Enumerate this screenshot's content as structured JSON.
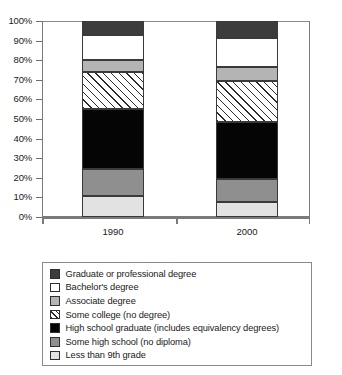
{
  "chart_data": {
    "type": "bar",
    "subtype": "stacked-bar-100-percent",
    "title": "",
    "xlabel": "",
    "ylabel": "",
    "categories": [
      "1990",
      "2000"
    ],
    "ylim": [
      0,
      100
    ],
    "ytick_labels": [
      "0%",
      "10%",
      "20%",
      "30%",
      "40%",
      "50%",
      "60%",
      "70%",
      "80%",
      "90%",
      "100%"
    ],
    "ytick_values": [
      0,
      10,
      20,
      30,
      40,
      50,
      60,
      70,
      80,
      90,
      100
    ],
    "grid": false,
    "legend_position": "below",
    "stack_order_bottom_to_top": [
      "Less than 9th grade",
      "Some high school (no diploma)",
      "High school graduate (includes equivalency degrees)",
      "Some college (no degree)",
      "Associate degree",
      "Bachelor's degree",
      "Graduate or professional degree"
    ],
    "series": [
      {
        "name": "Less than 9th grade",
        "fill": "#e2e2e2",
        "pattern": "solid",
        "values": [
          10.5,
          7.5
        ],
        "cumulative_top": [
          10.5,
          7.5
        ]
      },
      {
        "name": "Some high school (no diploma)",
        "fill": "#8f8f8f",
        "pattern": "solid",
        "values": [
          14.0,
          12.0
        ],
        "cumulative_top": [
          24.5,
          19.5
        ]
      },
      {
        "name": "High school graduate (includes equivalency degrees)",
        "fill": "#050505",
        "pattern": "solid",
        "values": [
          30.5,
          29.0
        ],
        "cumulative_top": [
          55.0,
          48.5
        ]
      },
      {
        "name": "Some college (no degree)",
        "fill": "#ffffff",
        "pattern": "diagonal-hatch",
        "values": [
          19.0,
          21.0
        ],
        "cumulative_top": [
          74.0,
          69.5
        ]
      },
      {
        "name": "Associate degree",
        "fill": "#b4b4b4",
        "pattern": "solid",
        "values": [
          6.0,
          7.0
        ],
        "cumulative_top": [
          80.0,
          76.5
        ]
      },
      {
        "name": "Bachelor's degree",
        "fill": "#ffffff",
        "pattern": "solid",
        "values": [
          13.0,
          15.0
        ],
        "cumulative_top": [
          93.0,
          91.5
        ]
      },
      {
        "name": "Graduate or professional degree",
        "fill": "#3c3c3c",
        "pattern": "solid",
        "values": [
          7.0,
          8.5
        ],
        "cumulative_top": [
          100.0,
          100.0
        ]
      }
    ]
  },
  "legend": {
    "items": [
      {
        "label": "Graduate or professional degree",
        "fill": "#3c3c3c",
        "pattern": "solid"
      },
      {
        "label": "Bachelor's degree",
        "fill": "#ffffff",
        "pattern": "solid"
      },
      {
        "label": "Associate degree",
        "fill": "#b4b4b4",
        "pattern": "solid"
      },
      {
        "label": "Some college (no degree)",
        "fill": "#ffffff",
        "pattern": "diagonal-hatch"
      },
      {
        "label": "High school graduate (includes equivalency degrees)",
        "fill": "#050505",
        "pattern": "solid"
      },
      {
        "label": "Some high school (no diploma)",
        "fill": "#8f8f8f",
        "pattern": "solid"
      },
      {
        "label": "Less than 9th grade",
        "fill": "#e2e2e2",
        "pattern": "solid"
      }
    ]
  },
  "colors": {
    "axis": "#7a7a7a",
    "text": "#1a1a1a",
    "segment_outline": "#3a3a3a",
    "background": "#ffffff"
  }
}
